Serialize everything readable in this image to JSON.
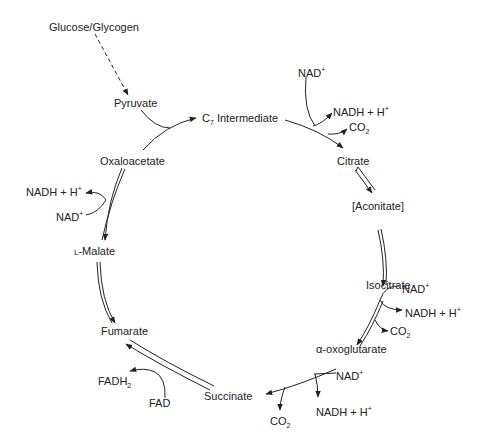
{
  "entry": {
    "source": "Glucose/Glycogen",
    "pyruvate": "Pyruvate"
  },
  "metabolites": {
    "c7": "C",
    "c7_sub": "7",
    "c7_rest": " Intermediate",
    "citrate": "Citrate",
    "aconitate": "[Aconitate]",
    "isocitrate": "Isocitrate",
    "aoxo": "α-oxoglutarate",
    "succinate": "Succinate",
    "fumarate": "Fumarate",
    "malate_prefix": "L",
    "malate": "-Malate",
    "oxaloacetate": "Oxaloacetate"
  },
  "cofactors": {
    "c7_citrate": {
      "in": "NAD",
      "out": "NADH + H",
      "co2": "CO"
    },
    "iso_aoxo": {
      "in": "NAD",
      "out": "NADH + H",
      "co2": "CO"
    },
    "aoxo_succ": {
      "in": "NAD",
      "out": "NADH + H",
      "co2": "CO"
    },
    "succ_fum": {
      "in": "FAD",
      "out": "FADH"
    },
    "mal_oxa": {
      "in": "NAD",
      "out": "NADH + H"
    }
  },
  "symbols": {
    "plus": "+",
    "two": "2"
  },
  "colors": {
    "ink": "#222222",
    "background": "#ffffff"
  }
}
